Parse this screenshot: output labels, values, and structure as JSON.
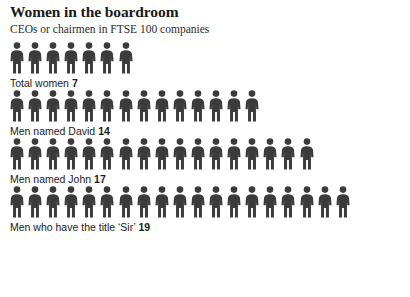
{
  "header": {
    "title": "Women in the boardroom",
    "subtitle": "CEOs or chairmen in FTSE 100 companies"
  },
  "colors": {
    "background": "#ffffff",
    "figure": "#3b3b3b",
    "title_text": "#1a1a1a",
    "label_text": "#1a1a1a"
  },
  "chart_data": {
    "type": "bar",
    "title": "Women in the boardroom",
    "subtitle": "CEOs or chairmen in FTSE 100 companies",
    "xlabel": "",
    "ylabel": "",
    "unit": "people",
    "symbol_value": 1,
    "categories": [
      "Total women",
      "Men named David",
      "Men named John",
      "Men who have the title ‘Sir’"
    ],
    "values": [
      7,
      14,
      17,
      19
    ],
    "series": [
      {
        "name": "CEOs or chairmen in FTSE 100 companies",
        "values": [
          7,
          14,
          17,
          19
        ]
      }
    ],
    "grid": false,
    "legend": "none",
    "xlim": [
      0,
      19
    ]
  },
  "rows": [
    {
      "label": "Total women",
      "value": 7,
      "value_text": "7",
      "icon": "person-pictogram"
    },
    {
      "label": "Men named David",
      "value": 14,
      "value_text": "14",
      "icon": "person-pictogram"
    },
    {
      "label": "Men named John",
      "value": 17,
      "value_text": "17",
      "icon": "person-pictogram"
    },
    {
      "label": "Men who have the title ‘Sir’",
      "value": 19,
      "value_text": "19",
      "icon": "person-pictogram"
    }
  ]
}
